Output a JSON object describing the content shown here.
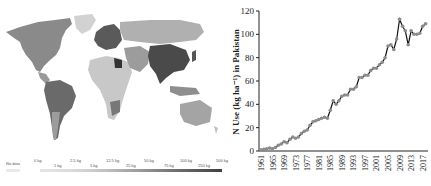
{
  "map": {
    "legend": {
      "no_data": "No data",
      "upper_labels": [
        "0 kg",
        "2.5 kg",
        "12.5 kg",
        "50 kg",
        "100 kg",
        "500 kg"
      ],
      "lower_labels": [
        "1 kg",
        "5 kg",
        "25 kg",
        "75 kg",
        "250 kg"
      ],
      "colors": [
        "#e4e4e4",
        "#d6d6d6",
        "#c4c4c4",
        "#adadad",
        "#959595",
        "#7c7c7c",
        "#626262",
        "#4a4a4a",
        "#333333"
      ]
    }
  },
  "chart_data": {
    "type": "line",
    "title": "",
    "xlabel": "",
    "ylabel": "N Use (kg ha⁻¹) in Pakistan",
    "ylim": [
      0,
      120
    ],
    "yticks": [
      0,
      20,
      40,
      60,
      80,
      100,
      120
    ],
    "xtick_labels": [
      "1961",
      "1965",
      "1969",
      "1973",
      "1977",
      "1981",
      "1985",
      "1989",
      "1993",
      "1997",
      "2001",
      "2005",
      "2009",
      "2013",
      "2017"
    ],
    "grid": false,
    "legend": null,
    "series": [
      {
        "name": "N Use",
        "x": [
          1961,
          1962,
          1963,
          1964,
          1965,
          1966,
          1967,
          1968,
          1969,
          1970,
          1971,
          1972,
          1973,
          1974,
          1975,
          1976,
          1977,
          1978,
          1979,
          1980,
          1981,
          1982,
          1983,
          1984,
          1985,
          1986,
          1987,
          1988,
          1989,
          1990,
          1991,
          1992,
          1993,
          1994,
          1995,
          1996,
          1997,
          1998,
          1999,
          2000,
          2001,
          2002,
          2003,
          2004,
          2005,
          2006,
          2007,
          2008,
          2009,
          2010,
          2011,
          2012,
          2013,
          2014,
          2015,
          2016,
          2017,
          2018
        ],
        "values": [
          1,
          1.5,
          2,
          2.5,
          2,
          3,
          5,
          6,
          8,
          7,
          10,
          12,
          11,
          12,
          15,
          17,
          18,
          22,
          25,
          26,
          27,
          28,
          29,
          28,
          35,
          43,
          40,
          43,
          47,
          48,
          48,
          53,
          53,
          55,
          63,
          63,
          65,
          65,
          69,
          71,
          71,
          74,
          76,
          80,
          90,
          91,
          87,
          96,
          113,
          107,
          103,
          91,
          103,
          100,
          100,
          101,
          107,
          109
        ]
      }
    ]
  }
}
